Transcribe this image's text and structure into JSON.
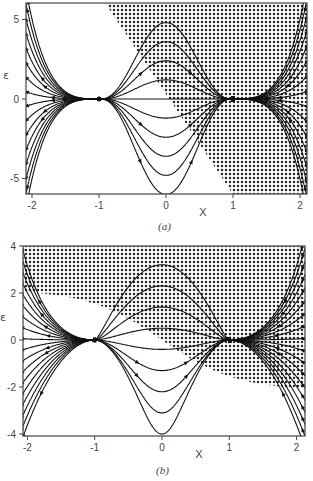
{
  "chart_data": [
    {
      "type": "line",
      "subtype": "phase-portrait",
      "caption": "(a)",
      "xlabel": "X",
      "ylabel": "ε",
      "xlim": [
        -2.1,
        2.1
      ],
      "ylim": [
        -6,
        6
      ],
      "xticks": [
        -2,
        -1,
        0,
        1,
        2
      ],
      "xtick_labels": [
        "-2",
        "-1",
        "0",
        "1",
        "2"
      ],
      "yticks": [
        5,
        0,
        -5
      ],
      "ytick_labels": [
        "5",
        "0",
        "-5"
      ],
      "grid": false,
      "fixed_points": [
        {
          "x": -1,
          "y": 0,
          "type": "stable node"
        },
        {
          "x": 1,
          "y": 0,
          "type": "unstable node"
        }
      ],
      "hatched_region": {
        "description": "region right of line from (-0.95, 6) to (1.05, -6)",
        "boundary": [
          [
            -0.95,
            6
          ],
          [
            1.05,
            -6
          ]
        ]
      },
      "frame": {
        "left": 26,
        "top": 3,
        "right": 307,
        "bottom": 194
      }
    },
    {
      "type": "line",
      "subtype": "phase-portrait",
      "caption": "(b)",
      "xlabel": "X",
      "ylabel": "ε",
      "xlim": [
        -2.1,
        2.1
      ],
      "ylim": [
        -4,
        4
      ],
      "xticks": [
        -2,
        -1,
        0,
        1,
        2
      ],
      "xtick_labels": [
        "-2",
        "-1",
        "0",
        "1",
        "2"
      ],
      "yticks": [
        4,
        2,
        0,
        -2,
        -4
      ],
      "ytick_labels": [
        "4",
        "2",
        "0",
        "-2",
        "-4"
      ],
      "grid": false,
      "fixed_points": [
        {
          "x": -1,
          "y": 0,
          "type": "stable node"
        },
        {
          "x": 1,
          "y": 0,
          "type": "unstable node"
        }
      ],
      "hatched_region": {
        "description": "region above curve from (-2, 2) through (0, 0) to (2, -2.2)",
        "boundary": [
          [
            -2.1,
            2.1
          ],
          [
            -1,
            1.2
          ],
          [
            0,
            0
          ],
          [
            1,
            -1.4
          ],
          [
            2.1,
            -2.2
          ]
        ]
      },
      "frame": {
        "left": 23,
        "top": 246,
        "right": 305,
        "bottom": 436
      }
    }
  ]
}
